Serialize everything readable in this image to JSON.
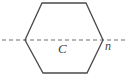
{
  "figure": {
    "background_color": "#ffffff",
    "width": 132,
    "height": 81,
    "shape": {
      "name": "hexagon",
      "sides": 6,
      "stroke_color": "#4a4a4a",
      "stroke_width": 1.3,
      "fill": "none",
      "vertices": [
        {
          "id": "left",
          "x": 25,
          "y": 40
        },
        {
          "id": "top-left",
          "x": 42,
          "y": 3
        },
        {
          "id": "top-right",
          "x": 86,
          "y": 3
        },
        {
          "id": "right",
          "x": 103,
          "y": 40
        },
        {
          "id": "bottom-right",
          "x": 87,
          "y": 73
        },
        {
          "id": "bottom-left",
          "x": 43,
          "y": 73
        }
      ]
    },
    "axis": {
      "name": "axis-of-symmetry",
      "orientation": "horizontal",
      "y": 40,
      "x_start": 2,
      "x_end": 126,
      "style": "dashed",
      "dash_pattern": "4 3",
      "stroke_color": "#6f6f6f",
      "stroke_width": 1.1
    },
    "labels": {
      "center": "C",
      "vertex_n": "n"
    }
  }
}
